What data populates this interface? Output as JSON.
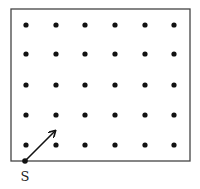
{
  "diagram": {
    "grid": {
      "columns": [
        26,
        56,
        85,
        115,
        145,
        174
      ],
      "rows": [
        25,
        54,
        85,
        115,
        145
      ],
      "dot_color": "#111111"
    },
    "frame": {
      "x": 11,
      "y": 9,
      "width": 179,
      "height": 152,
      "stroke": "#444444"
    },
    "start_point": {
      "label": "S",
      "x": 25,
      "y": 161
    },
    "arrow": {
      "from": [
        25,
        161
      ],
      "to": [
        55,
        131
      ]
    }
  }
}
